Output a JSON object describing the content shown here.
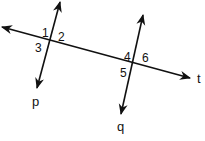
{
  "diagram": {
    "type": "geometry",
    "colors": {
      "stroke": "#111111",
      "background": "#ffffff"
    },
    "lines": [
      {
        "id": "t",
        "label": "t",
        "from": [
          2,
          27
        ],
        "to": [
          190,
          78
        ],
        "arrows": "both"
      },
      {
        "id": "p",
        "label": "p",
        "from": [
          60,
          2
        ],
        "to": [
          37,
          88
        ],
        "arrows": "both"
      },
      {
        "id": "q",
        "label": "q",
        "from": [
          143,
          15
        ],
        "to": [
          121,
          114
        ],
        "arrows": "both"
      }
    ],
    "line_labels": {
      "t": "t",
      "p": "p",
      "q": "q"
    },
    "intersections": [
      {
        "lines": [
          "p",
          "t"
        ],
        "point": [
          51,
          40
        ],
        "angles": [
          "1",
          "2",
          "3"
        ]
      },
      {
        "lines": [
          "q",
          "t"
        ],
        "point": [
          135,
          63
        ],
        "angles": [
          "4",
          "6",
          "5"
        ]
      }
    ],
    "angle_labels": {
      "a1": "1",
      "a2": "2",
      "a3": "3",
      "a4": "4",
      "a5": "5",
      "a6": "6"
    }
  }
}
